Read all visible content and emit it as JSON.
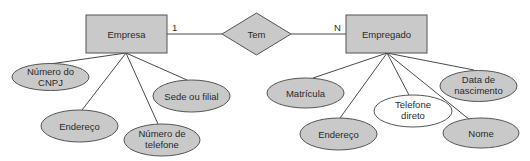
{
  "diagram": {
    "type": "entity-relationship",
    "colors": {
      "shape_fill": "#c9c9c9",
      "shape_stroke": "#555555",
      "line": "#4a4a4a",
      "text": "#2a2a2a",
      "white_attribute_fill": "#ffffff"
    },
    "entities": [
      {
        "id": "empresa",
        "label": "Empresa"
      },
      {
        "id": "empregado",
        "label": "Empregado"
      }
    ],
    "relationship": {
      "label": "Tem",
      "left_cardinality": "1",
      "right_cardinality": "N"
    },
    "empresa_attributes": [
      {
        "line1": "Número do",
        "line2": "CNPJ"
      },
      {
        "line1": "Endereço",
        "line2": ""
      },
      {
        "line1": "Número de",
        "line2": "telefone"
      },
      {
        "line1": "Sede ou filial",
        "line2": ""
      }
    ],
    "empregado_attributes": [
      {
        "line1": "Matrícula",
        "line2": ""
      },
      {
        "line1": "Endereço",
        "line2": ""
      },
      {
        "line1": "Telefone",
        "line2": "direto",
        "style": "white"
      },
      {
        "line1": "Nome",
        "line2": ""
      },
      {
        "line1": "Data de",
        "line2": "nascimento"
      }
    ]
  }
}
